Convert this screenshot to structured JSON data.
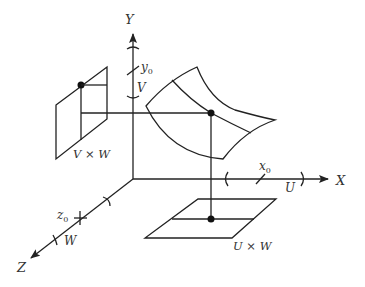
{
  "diagram": {
    "type": "3d-coordinate-projection",
    "colors": {
      "stroke": "#222222",
      "text": "#333333",
      "background": "#ffffff"
    },
    "axes": {
      "x": {
        "label": "X",
        "point_label": "x",
        "point_sub": "0",
        "interval_label": "U"
      },
      "y": {
        "label": "Y",
        "point_label": "y",
        "point_sub": "0",
        "interval_label": "V"
      },
      "z": {
        "label": "Z",
        "point_label": "z",
        "point_sub": "0",
        "interval_label": "W"
      }
    },
    "planes": {
      "vw": {
        "label": "V × W"
      },
      "uw": {
        "label": "U × W"
      }
    },
    "surface": {
      "description": "curved surface patch with point projected onto V×W and U×W planes"
    }
  }
}
